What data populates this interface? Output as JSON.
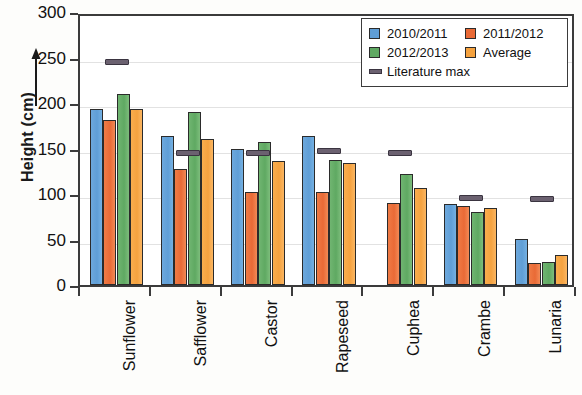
{
  "chart_data": {
    "type": "bar",
    "title": "",
    "xlabel": "",
    "ylabel": "Height (cm)",
    "ylim": [
      0,
      300
    ],
    "yticks": [
      0,
      50,
      100,
      150,
      200,
      250,
      300
    ],
    "grid": true,
    "legend_position": "top-right",
    "categories": [
      "Sunflower",
      "Safflower",
      "Castor",
      "Rapeseed",
      "Cuphea",
      "Crambe",
      "Lunaria"
    ],
    "series": [
      {
        "name": "2010/2011",
        "color": "#5f9ed6",
        "values": [
          193,
          164,
          150,
          164,
          null,
          89,
          51
        ]
      },
      {
        "name": "2011/2012",
        "color": "#e96a36",
        "values": [
          181,
          128,
          102,
          102,
          90,
          87,
          24
        ]
      },
      {
        "name": "2012/2013",
        "color": "#5fa962",
        "values": [
          210,
          190,
          157,
          137,
          122,
          80,
          25
        ]
      },
      {
        "name": "Average",
        "color": "#f5a23f",
        "values": [
          193,
          160,
          136,
          134,
          107,
          85,
          33
        ]
      }
    ],
    "marker_series": {
      "name": "Literature max",
      "color": "#6b6170",
      "values": [
        250,
        150,
        150,
        152,
        150,
        100,
        99
      ]
    }
  },
  "legend": {
    "entries": [
      {
        "label": "2010/2011"
      },
      {
        "label": "2011/2012"
      },
      {
        "label": "2012/2013"
      },
      {
        "label": "Average"
      },
      {
        "label": "Literature max"
      }
    ]
  },
  "axis": {
    "y_title": "Height (cm)",
    "y_tick_labels": [
      "0",
      "50",
      "100",
      "150",
      "200",
      "250",
      "300"
    ]
  }
}
